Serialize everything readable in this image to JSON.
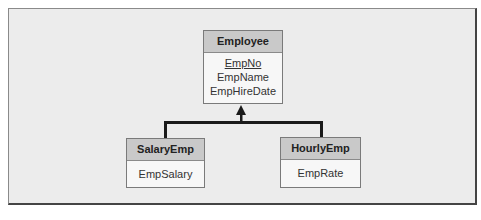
{
  "diagram": {
    "type": "class-inheritance",
    "parent": {
      "name": "Employee",
      "attributes": [
        {
          "name": "EmpNo",
          "primary_key": true
        },
        {
          "name": "EmpName",
          "primary_key": false
        },
        {
          "name": "EmpHireDate",
          "primary_key": false
        }
      ]
    },
    "children": [
      {
        "name": "SalaryEmp",
        "attributes": [
          {
            "name": "EmpSalary"
          }
        ]
      },
      {
        "name": "HourlyEmp",
        "attributes": [
          {
            "name": "EmpRate"
          }
        ]
      }
    ],
    "relationship": "generalization",
    "colors": {
      "background": "#ececec",
      "header": "#c9c9c9",
      "box": "#f7f7f7",
      "line": "#1a1a1a"
    }
  }
}
